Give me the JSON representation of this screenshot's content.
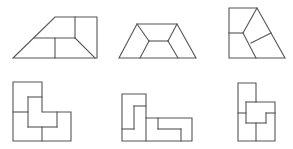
{
  "diagram": {
    "stroke_color": "#555555",
    "background": "#ffffff",
    "figures": [
      {
        "id": "figure-1",
        "row": 1,
        "col": 1,
        "shape": "right trapezoid divided into 4 pieces"
      },
      {
        "id": "figure-2",
        "row": 1,
        "col": 2,
        "shape": "isosceles trapezoid divided into 4 pieces"
      },
      {
        "id": "figure-3",
        "row": 1,
        "col": 3,
        "shape": "right trapezoid (tall) divided into 4 pieces"
      },
      {
        "id": "figure-4",
        "row": 2,
        "col": 1,
        "shape": "L-shape divided into 4 pieces"
      },
      {
        "id": "figure-5",
        "row": 2,
        "col": 2,
        "shape": "L-shape (wide) divided into 4 pieces"
      },
      {
        "id": "figure-6",
        "row": 2,
        "col": 3,
        "shape": "stepped shape divided into 4 pieces"
      }
    ]
  }
}
